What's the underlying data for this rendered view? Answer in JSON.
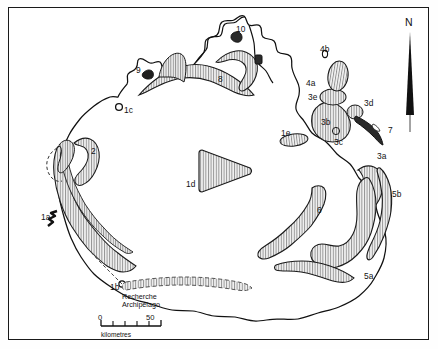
{
  "figure": {
    "kind": "distribution-map",
    "region": "Australia",
    "frame": "thin black rectangle border"
  },
  "north_arrow": {
    "letter": "N",
    "icon": "north-arrow-icon",
    "color": "#111111"
  },
  "scale_bar": {
    "min_label": "0",
    "max_label": "50",
    "unit_label": "kilometres",
    "tick_count": 5
  },
  "place_labels": [
    {
      "id": "recherche",
      "line1": "Recherche",
      "line2": "Archipelago",
      "x": 122,
      "y": 292
    }
  ],
  "map_labels": [
    {
      "text": "1a",
      "x": 41,
      "y": 213
    },
    {
      "text": "1b",
      "x": 110,
      "y": 283
    },
    {
      "text": "1c",
      "x": 124,
      "y": 106
    },
    {
      "text": "1d",
      "x": 186,
      "y": 180
    },
    {
      "text": "1e",
      "x": 281,
      "y": 129
    },
    {
      "text": "2",
      "x": 91,
      "y": 147
    },
    {
      "text": "3a",
      "x": 377,
      "y": 152
    },
    {
      "text": "3b",
      "x": 321,
      "y": 118
    },
    {
      "text": "3c",
      "x": 334,
      "y": 138
    },
    {
      "text": "3d",
      "x": 364,
      "y": 99
    },
    {
      "text": "3e",
      "x": 308,
      "y": 93
    },
    {
      "text": "4a",
      "x": 306,
      "y": 79
    },
    {
      "text": "4b",
      "x": 320,
      "y": 45
    },
    {
      "text": "5a",
      "x": 364,
      "y": 272
    },
    {
      "text": "5b",
      "x": 392,
      "y": 190
    },
    {
      "text": "6",
      "x": 317,
      "y": 206
    },
    {
      "text": "7",
      "x": 388,
      "y": 126
    },
    {
      "text": "8",
      "x": 218,
      "y": 75
    },
    {
      "text": "9",
      "x": 136,
      "y": 66
    },
    {
      "text": "10",
      "x": 236,
      "y": 25
    }
  ],
  "colors": {
    "ink": "#1a1a1a",
    "coastline": "#111111",
    "hatch_line": "#8d8d8d",
    "hatch_fill": "#f0f0f0",
    "region_outline": "#1a1a1a",
    "solid_black": "#111111",
    "background": "#ffffff"
  }
}
